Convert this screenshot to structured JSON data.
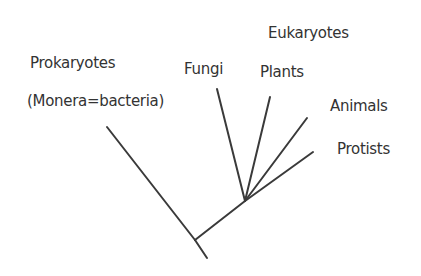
{
  "title": "Eukaryotes",
  "colors": {
    "line": "#3a3a3a",
    "text": "#333333",
    "background": "#ffffff"
  },
  "groups": {
    "prokaryotes": {
      "label": "Prokaryotes",
      "sublabel": "(Monera=bacteria)"
    },
    "eukaryotes": {
      "label": "Eukaryotes"
    }
  },
  "taxa": [
    {
      "name": "Fungi"
    },
    {
      "name": "Plants"
    },
    {
      "name": "Animals"
    },
    {
      "name": "Protists"
    }
  ],
  "tree": {
    "root": [
      195,
      240
    ],
    "root_tail": [
      207,
      258
    ],
    "eukaryote_node": [
      245,
      201
    ],
    "branches": [
      {
        "taxon": "Prokaryotes",
        "from": [
          195,
          240
        ],
        "to": [
          107,
          127
        ]
      },
      {
        "taxon": "Eukaryote stem",
        "from": [
          195,
          240
        ],
        "to": [
          245,
          201
        ]
      },
      {
        "taxon": "Fungi",
        "from": [
          245,
          201
        ],
        "to": [
          217,
          89
        ]
      },
      {
        "taxon": "Plants",
        "from": [
          245,
          201
        ],
        "to": [
          270,
          97
        ]
      },
      {
        "taxon": "Animals",
        "from": [
          245,
          201
        ],
        "to": [
          307,
          118
        ]
      },
      {
        "taxon": "Protists",
        "from": [
          245,
          201
        ],
        "to": [
          313,
          152
        ]
      }
    ]
  }
}
